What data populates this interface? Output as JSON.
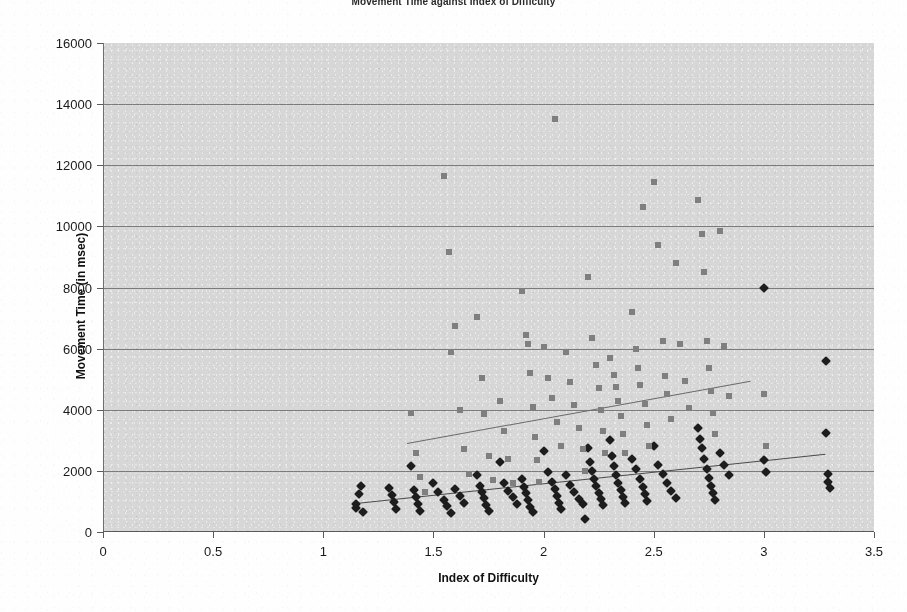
{
  "chart_data": {
    "type": "scatter",
    "title": "Movement Time against Index of Difficulty",
    "xlabel": "Index of Difficulty",
    "ylabel": "Movement Time (in msec)",
    "xlim": [
      0,
      3.5
    ],
    "ylim": [
      0,
      16000
    ],
    "xticks": [
      "0",
      "0.5",
      "1",
      "1.5",
      "2",
      "2.5",
      "3",
      "3.5"
    ],
    "xtick_values": [
      0,
      0.5,
      1,
      1.5,
      2,
      2.5,
      3,
      3.5
    ],
    "yticks": [
      "0",
      "2000",
      "4000",
      "6000",
      "8000",
      "10000",
      "12000",
      "14000",
      "16000"
    ],
    "ytick_values": [
      0,
      2000,
      4000,
      6000,
      8000,
      10000,
      12000,
      14000,
      16000
    ],
    "grid": true,
    "grid_axis": "y",
    "legend": "none",
    "plot_background": "#d7d7d7",
    "series": [
      {
        "name": "series-diamond-dark",
        "marker": "diamond",
        "color": "#1d1d1d",
        "points": [
          [
            1.15,
            780
          ],
          [
            1.15,
            900
          ],
          [
            1.16,
            1250
          ],
          [
            1.17,
            1500
          ],
          [
            1.18,
            640
          ],
          [
            1.3,
            1450
          ],
          [
            1.31,
            1200
          ],
          [
            1.32,
            980
          ],
          [
            1.33,
            760
          ],
          [
            1.4,
            2150
          ],
          [
            1.41,
            1380
          ],
          [
            1.42,
            1150
          ],
          [
            1.43,
            900
          ],
          [
            1.44,
            700
          ],
          [
            1.5,
            1600
          ],
          [
            1.52,
            1320
          ],
          [
            1.55,
            1050
          ],
          [
            1.56,
            860
          ],
          [
            1.58,
            620
          ],
          [
            1.6,
            1420
          ],
          [
            1.62,
            1180
          ],
          [
            1.64,
            950
          ],
          [
            1.7,
            1880
          ],
          [
            1.71,
            1520
          ],
          [
            1.72,
            1300
          ],
          [
            1.73,
            1100
          ],
          [
            1.74,
            880
          ],
          [
            1.75,
            700
          ],
          [
            1.8,
            2300
          ],
          [
            1.82,
            1600
          ],
          [
            1.84,
            1350
          ],
          [
            1.86,
            1150
          ],
          [
            1.88,
            930
          ],
          [
            1.9,
            1750
          ],
          [
            1.91,
            1480
          ],
          [
            1.92,
            1280
          ],
          [
            1.93,
            1050
          ],
          [
            1.94,
            820
          ],
          [
            1.95,
            640
          ],
          [
            2.0,
            2650
          ],
          [
            2.02,
            1950
          ],
          [
            2.04,
            1620
          ],
          [
            2.05,
            1400
          ],
          [
            2.06,
            1180
          ],
          [
            2.07,
            960
          ],
          [
            2.08,
            760
          ],
          [
            2.1,
            1850
          ],
          [
            2.12,
            1550
          ],
          [
            2.14,
            1300
          ],
          [
            2.16,
            1080
          ],
          [
            2.18,
            900
          ],
          [
            2.19,
            420
          ],
          [
            2.2,
            2750
          ],
          [
            2.21,
            2300
          ],
          [
            2.22,
            1980
          ],
          [
            2.23,
            1720
          ],
          [
            2.24,
            1500
          ],
          [
            2.25,
            1280
          ],
          [
            2.26,
            1080
          ],
          [
            2.27,
            880
          ],
          [
            2.3,
            3000
          ],
          [
            2.31,
            2500
          ],
          [
            2.32,
            2150
          ],
          [
            2.33,
            1850
          ],
          [
            2.34,
            1600
          ],
          [
            2.35,
            1380
          ],
          [
            2.36,
            1150
          ],
          [
            2.37,
            950
          ],
          [
            2.4,
            2400
          ],
          [
            2.42,
            2050
          ],
          [
            2.44,
            1750
          ],
          [
            2.45,
            1480
          ],
          [
            2.46,
            1250
          ],
          [
            2.47,
            1020
          ],
          [
            2.5,
            2800
          ],
          [
            2.52,
            2200
          ],
          [
            2.54,
            1900
          ],
          [
            2.56,
            1600
          ],
          [
            2.58,
            1350
          ],
          [
            2.6,
            1100
          ],
          [
            2.7,
            3400
          ],
          [
            2.71,
            3050
          ],
          [
            2.72,
            2750
          ],
          [
            2.73,
            2400
          ],
          [
            2.74,
            2050
          ],
          [
            2.75,
            1780
          ],
          [
            2.76,
            1520
          ],
          [
            2.77,
            1280
          ],
          [
            2.78,
            1050
          ],
          [
            2.8,
            2600
          ],
          [
            2.82,
            2200
          ],
          [
            2.84,
            1850
          ],
          [
            3.0,
            8000
          ],
          [
            3.0,
            2350
          ],
          [
            3.01,
            1950
          ],
          [
            3.28,
            5600
          ],
          [
            3.28,
            3250
          ],
          [
            3.29,
            1900
          ],
          [
            3.29,
            1650
          ],
          [
            3.3,
            1450
          ]
        ]
      },
      {
        "name": "series-square-gray",
        "marker": "square",
        "color": "#7f7f7f",
        "points": [
          [
            1.4,
            3900
          ],
          [
            1.42,
            2600
          ],
          [
            1.44,
            1800
          ],
          [
            1.46,
            1300
          ],
          [
            1.55,
            11650
          ],
          [
            1.57,
            9150
          ],
          [
            1.58,
            5900
          ],
          [
            1.6,
            6750
          ],
          [
            1.62,
            4000
          ],
          [
            1.64,
            2700
          ],
          [
            1.66,
            1900
          ],
          [
            1.7,
            7050
          ],
          [
            1.72,
            5050
          ],
          [
            1.73,
            3850
          ],
          [
            1.75,
            2500
          ],
          [
            1.77,
            1700
          ],
          [
            1.8,
            4300
          ],
          [
            1.82,
            3300
          ],
          [
            1.84,
            2400
          ],
          [
            1.86,
            1600
          ],
          [
            1.9,
            7900
          ],
          [
            1.92,
            6450
          ],
          [
            1.93,
            6150
          ],
          [
            1.94,
            5200
          ],
          [
            1.95,
            4100
          ],
          [
            1.96,
            3100
          ],
          [
            1.97,
            2350
          ],
          [
            1.98,
            1650
          ],
          [
            2.0,
            6050
          ],
          [
            2.02,
            5050
          ],
          [
            2.04,
            4400
          ],
          [
            2.05,
            13500
          ],
          [
            2.06,
            3600
          ],
          [
            2.08,
            2800
          ],
          [
            2.1,
            5900
          ],
          [
            2.12,
            4900
          ],
          [
            2.14,
            4150
          ],
          [
            2.16,
            3400
          ],
          [
            2.18,
            2700
          ],
          [
            2.19,
            2000
          ],
          [
            2.2,
            8350
          ],
          [
            2.22,
            6350
          ],
          [
            2.24,
            5450
          ],
          [
            2.25,
            4700
          ],
          [
            2.26,
            4000
          ],
          [
            2.27,
            3300
          ],
          [
            2.28,
            2600
          ],
          [
            2.3,
            5700
          ],
          [
            2.32,
            5150
          ],
          [
            2.33,
            4750
          ],
          [
            2.34,
            4300
          ],
          [
            2.35,
            3800
          ],
          [
            2.36,
            3200
          ],
          [
            2.37,
            2600
          ],
          [
            2.4,
            7200
          ],
          [
            2.42,
            6000
          ],
          [
            2.43,
            5350
          ],
          [
            2.44,
            4800
          ],
          [
            2.45,
            10650
          ],
          [
            2.46,
            4200
          ],
          [
            2.47,
            3500
          ],
          [
            2.48,
            2800
          ],
          [
            2.5,
            11450
          ],
          [
            2.52,
            9400
          ],
          [
            2.54,
            6250
          ],
          [
            2.55,
            5100
          ],
          [
            2.56,
            4500
          ],
          [
            2.58,
            3700
          ],
          [
            2.6,
            8800
          ],
          [
            2.62,
            6150
          ],
          [
            2.64,
            4950
          ],
          [
            2.66,
            4050
          ],
          [
            2.7,
            10850
          ],
          [
            2.72,
            9750
          ],
          [
            2.73,
            8500
          ],
          [
            2.74,
            6250
          ],
          [
            2.75,
            5350
          ],
          [
            2.76,
            4600
          ],
          [
            2.77,
            3900
          ],
          [
            2.78,
            3200
          ],
          [
            2.8,
            9850
          ],
          [
            2.82,
            6100
          ],
          [
            2.84,
            4450
          ],
          [
            3.0,
            4500
          ],
          [
            3.01,
            2800
          ]
        ]
      }
    ],
    "trendlines": [
      {
        "name": "upper-trendline",
        "series": "series-square-gray",
        "x0": 1.38,
        "y0": 2920,
        "x1": 2.94,
        "y1": 4960,
        "color": "#6a6a6a"
      },
      {
        "name": "lower-trendline",
        "series": "series-diamond-dark",
        "x0": 1.15,
        "y0": 950,
        "x1": 3.28,
        "y1": 2560,
        "color": "#4a4a4a"
      }
    ]
  }
}
